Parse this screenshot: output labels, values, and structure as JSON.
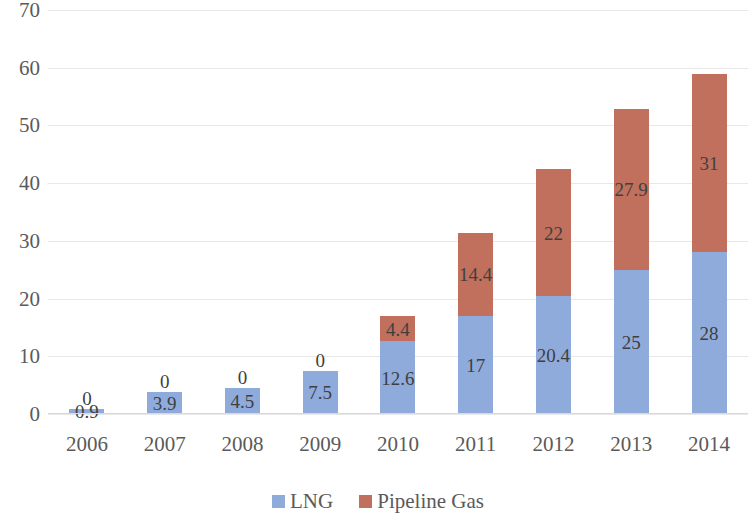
{
  "chart_data": {
    "type": "bar",
    "stacked": true,
    "title": "",
    "subtitle": "",
    "xlabel": "",
    "ylabel": "",
    "ylim": [
      0,
      70
    ],
    "ytick_step": 10,
    "ytick_labels": [
      "70",
      "60",
      "50",
      "40",
      "30",
      "20",
      "10",
      "0"
    ],
    "grid": true,
    "legend_position": "bottom-center",
    "categories": [
      "2006",
      "2007",
      "2008",
      "2009",
      "2010",
      "2011",
      "2012",
      "2013",
      "2014"
    ],
    "series": [
      {
        "name": "LNG",
        "color": "#8fabdc",
        "values": [
          0.9,
          3.9,
          4.5,
          7.5,
          12.6,
          17,
          20.4,
          25,
          28
        ],
        "data_labels": [
          "0.9",
          "3.9",
          "4.5",
          "7.5",
          "12.6",
          "17",
          "20.4",
          "25",
          "28"
        ]
      },
      {
        "name": "Pipeline Gas",
        "color": "#c0705c",
        "values": [
          0,
          0,
          0,
          0,
          4.4,
          14.4,
          22,
          27.9,
          31
        ],
        "data_labels": [
          "0",
          "0",
          "0",
          "0",
          "4.4",
          "14.4",
          "22",
          "27.9",
          "31"
        ]
      }
    ],
    "totals": [
      0.9,
      3.9,
      4.5,
      7.5,
      17.0,
      31.4,
      42.4,
      52.9,
      59.0
    ]
  },
  "legend": {
    "items": [
      {
        "label": "LNG",
        "color": "#8fabdc",
        "swatch": "legend-swatch-lng"
      },
      {
        "label": "Pipeline Gas",
        "color": "#c0705c",
        "swatch": "legend-swatch-pipeline"
      }
    ]
  },
  "colors": {
    "lng": "#8fabdc",
    "pipeline_gas": "#c0705c",
    "gridline": "#e8e8e8",
    "axis_text": "#5a5a5a",
    "data_label_text": "#3f3f3f",
    "background": "#ffffff"
  }
}
